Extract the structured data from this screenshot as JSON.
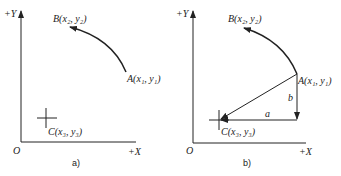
{
  "panel_a": {
    "y_axis_label": "+Y",
    "x_axis_label": "+X",
    "origin_label": "O",
    "point_b": "B(x₂, y₂)",
    "point_a": "A(x₁, y₁)",
    "point_c": "C(x₃, y₃)",
    "caption": "a)"
  },
  "panel_b": {
    "y_axis_label": "+Y",
    "x_axis_label": "+X",
    "origin_label": "O",
    "point_b": "B(x₂, y₂)",
    "point_a": "A(x₁, y₁)",
    "point_c": "C(x₃, y₃)",
    "seg_a": "a",
    "seg_b": "b",
    "caption": "b)"
  }
}
